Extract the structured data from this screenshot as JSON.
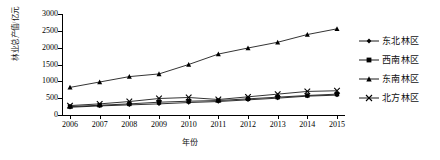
{
  "chart_data": {
    "type": "line",
    "title": "",
    "xlabel": "年份",
    "ylabel": "林业总产值/亿元",
    "x": [
      2006,
      2007,
      2008,
      2009,
      2010,
      2011,
      2012,
      2013,
      2014,
      2015
    ],
    "xtick_labels": [
      "2006",
      "2007",
      "2008",
      "2009",
      "2010",
      "2011",
      "2012",
      "2013",
      "2014",
      "2015"
    ],
    "ytick_labels": [
      "0",
      "500",
      "1000",
      "1500",
      "2000",
      "2500",
      "3000"
    ],
    "yticks": [
      0,
      500,
      1000,
      1500,
      2000,
      2500,
      3000
    ],
    "ylim": [
      0,
      3000
    ],
    "grid": false,
    "legend_position": "right",
    "series": [
      {
        "name": "东北林区",
        "marker": "diamond",
        "color": "#000000",
        "values": [
          230,
          270,
          300,
          330,
          370,
          400,
          450,
          500,
          560,
          590
        ]
      },
      {
        "name": "西南林区",
        "marker": "square",
        "color": "#000000",
        "values": [
          250,
          290,
          330,
          380,
          410,
          430,
          480,
          530,
          580,
          620
        ]
      },
      {
        "name": "东南林区",
        "marker": "triangle",
        "color": "#000000",
        "values": [
          820,
          980,
          1140,
          1220,
          1500,
          1810,
          1990,
          2160,
          2390,
          2560
        ]
      },
      {
        "name": "北方林区",
        "marker": "cross",
        "color": "#000000",
        "values": [
          280,
          330,
          400,
          490,
          520,
          460,
          540,
          620,
          700,
          720
        ]
      }
    ]
  },
  "legend": {
    "items": [
      {
        "label": "东北林区",
        "marker": "diamond"
      },
      {
        "label": "西南林区",
        "marker": "square"
      },
      {
        "label": "东南林区",
        "marker": "triangle"
      },
      {
        "label": "北方林区",
        "marker": "cross"
      }
    ]
  }
}
